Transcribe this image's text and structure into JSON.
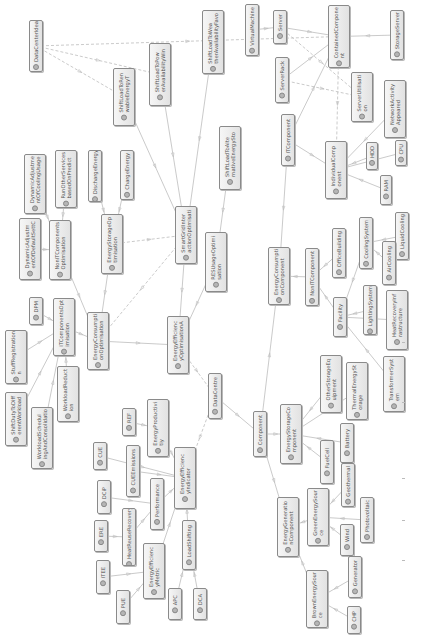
{
  "diagram": {
    "type": "uml-class-diagram",
    "orientation": "rotated-90-ccw",
    "colors": {
      "edge": "#bdbdbd",
      "node_border": "#8a8a8a",
      "node_fill": "#ececec",
      "text": "#555555"
    },
    "nodes": [
      {
        "id": "DataCenterIdea",
        "label": "DataCenterIdea",
        "x": 29,
        "y": 20,
        "w": 14,
        "h": 52
      },
      {
        "id": "ShiftLoadFutureAvailRenewable",
        "label": "ShiftLoadToRen\nwableEnergyT",
        "x": 113,
        "y": 68,
        "w": 22,
        "h": 58
      },
      {
        "id": "ShiftLoadToPowerAvailable",
        "label": "ShiftLoadToPow\nerAvailabilityWin",
        "x": 149,
        "y": 43,
        "w": 22,
        "h": 63
      },
      {
        "id": "ShiftLoadToWeatherFavor",
        "label": "ShiftLoadToWea\ntherAvailabilityFavo",
        "x": 202,
        "y": 10,
        "w": 22,
        "h": 64
      },
      {
        "id": "VirtualMachine",
        "label": "VirtualMachine",
        "x": 245,
        "y": 4,
        "w": 14,
        "h": 52
      },
      {
        "id": "Server",
        "label": "Server",
        "x": 273,
        "y": 10,
        "w": 14,
        "h": 34
      },
      {
        "id": "ContainedComponent",
        "label": "ContainedCompone\nnt",
        "x": 328,
        "y": 5,
        "w": 22,
        "h": 63
      },
      {
        "id": "StorageServer",
        "label": "StorageServer",
        "x": 390,
        "y": 10,
        "w": 14,
        "h": 50
      },
      {
        "id": "ServerRack",
        "label": "ServerRack",
        "x": 275,
        "y": 57,
        "w": 14,
        "h": 46
      },
      {
        "id": "ServerUtilisation",
        "label": "ServerUtilisati\non",
        "x": 351,
        "y": 72,
        "w": 22,
        "h": 50
      },
      {
        "id": "NetworkActivity",
        "label": "NetworkActivity\nAppeared",
        "x": 384,
        "y": 80,
        "w": 22,
        "h": 58
      },
      {
        "id": "ITComponent",
        "label": "ITComponent",
        "x": 281,
        "y": 114,
        "w": 14,
        "h": 52
      },
      {
        "id": "IndividualComponent",
        "label": "IndividualComp\nonent",
        "x": 325,
        "y": 141,
        "w": 22,
        "h": 58
      },
      {
        "id": "HDD",
        "label": "HDD",
        "x": 366,
        "y": 142,
        "w": 12,
        "h": 28
      },
      {
        "id": "CPU",
        "label": "CPU",
        "x": 395,
        "y": 140,
        "w": 12,
        "h": 26
      },
      {
        "id": "RAM",
        "label": "RAM",
        "x": 380,
        "y": 175,
        "w": 12,
        "h": 30
      },
      {
        "id": "ShiftLoadToAlternativeEnergy",
        "label": "ShiftLoadToAlte\nrnativeEnergySto",
        "x": 219,
        "y": 126,
        "w": 22,
        "h": 64
      },
      {
        "id": "RESUsageOptimisation",
        "label": "RESUsageOptimi\nsation",
        "x": 205,
        "y": 232,
        "w": 22,
        "h": 60
      },
      {
        "id": "SmartGridInteractionOptimisation",
        "label": "SmartGridInter\nactionOptimisati",
        "x": 175,
        "y": 206,
        "w": 22,
        "h": 58
      },
      {
        "id": "DischargeEnergy",
        "label": "DischargeEnergy",
        "x": 88,
        "y": 150,
        "w": 14,
        "h": 52
      },
      {
        "id": "ChargeEnergy",
        "label": "ChargeEnergy",
        "x": 120,
        "y": 150,
        "w": 14,
        "h": 50
      },
      {
        "id": "RunOtherServices",
        "label": "RunOtherServices\nbasedOnPredict",
        "x": 55,
        "y": 150,
        "w": 22,
        "h": 58
      },
      {
        "id": "DynamicAdjustmentOfCooling",
        "label": "DynamicAdjustme\nntOfCoolingUsage",
        "x": 24,
        "y": 154,
        "w": 22,
        "h": 60
      },
      {
        "id": "DynamicAdjustmentDefaultSettings",
        "label": "DynamicAdjustm\nentOfDefaultSettC",
        "x": 19,
        "y": 218,
        "w": 22,
        "h": 62
      },
      {
        "id": "NonITComponentsOptimisation",
        "label": "NonITComponents\nOptimisation",
        "x": 49,
        "y": 220,
        "w": 22,
        "h": 60
      },
      {
        "id": "EnergyStorageOptimisation",
        "label": "EnergyStorageOp\ntimisation",
        "x": 101,
        "y": 214,
        "w": 22,
        "h": 60
      },
      {
        "id": "DPM",
        "label": "DPM",
        "x": 29,
        "y": 297,
        "w": 14,
        "h": 28
      },
      {
        "id": "ITComponentsOptimisation",
        "label": "ITComponentsOpt\nimisation",
        "x": 53,
        "y": 298,
        "w": 22,
        "h": 58
      },
      {
        "id": "EnergyConsumptionOptimisation",
        "label": "EnergyConsumpti\nonOptimisation",
        "x": 87,
        "y": 312,
        "w": 22,
        "h": 58
      },
      {
        "id": "EnergyEfficiencyOptimisation",
        "label": "EnergyEfficienc\nyOptimisationA",
        "x": 167,
        "y": 316,
        "w": 22,
        "h": 58
      },
      {
        "id": "StuffRegistration",
        "label": "StuffRegistration\nn",
        "x": 5,
        "y": 330,
        "w": 22,
        "h": 54
      },
      {
        "id": "WorkloadReduction",
        "label": "WorkloadReduct\nion",
        "x": 57,
        "y": 366,
        "w": 22,
        "h": 56
      },
      {
        "id": "ShiftDutyToDifferentWorkload",
        "label": "ShiftDutyToDiff\nerentWorkload",
        "x": 5,
        "y": 392,
        "w": 22,
        "h": 54
      },
      {
        "id": "WorkloadSchedulingConsolidation",
        "label": "WorkloadSchedul\ningAndConsolidatio",
        "x": 31,
        "y": 407,
        "w": 22,
        "h": 62
      },
      {
        "id": "DataCentre",
        "label": "DataCentre",
        "x": 208,
        "y": 373,
        "w": 14,
        "h": 46
      },
      {
        "id": "REF",
        "label": "REF",
        "x": 122,
        "y": 408,
        "w": 14,
        "h": 28
      },
      {
        "id": "EnergyProductivity",
        "label": "EnergyProductivi\ntiy",
        "x": 147,
        "y": 399,
        "w": 22,
        "h": 58
      },
      {
        "id": "CUE",
        "label": "CUE",
        "x": 93,
        "y": 442,
        "w": 14,
        "h": 28
      },
      {
        "id": "CUEEmissions",
        "label": "CUEEmissions",
        "x": 126,
        "y": 445,
        "w": 14,
        "h": 52
      },
      {
        "id": "EnergyEfficiencyIndicator",
        "label": "EnergyEfficienc\nyIndicator",
        "x": 174,
        "y": 447,
        "w": 22,
        "h": 62
      },
      {
        "id": "DCiP",
        "label": "DCiP",
        "x": 97,
        "y": 480,
        "w": 14,
        "h": 34
      },
      {
        "id": "Performance",
        "label": "Performance",
        "x": 150,
        "y": 478,
        "w": 14,
        "h": 52
      },
      {
        "id": "ERE",
        "label": "ERE",
        "x": 94,
        "y": 520,
        "w": 14,
        "h": 32
      },
      {
        "id": "HeatReuseRecovery",
        "label": "HeatReuseRecovery",
        "x": 122,
        "y": 508,
        "w": 14,
        "h": 58
      },
      {
        "id": "LoadShifting",
        "label": "LoadShifting",
        "x": 182,
        "y": 520,
        "w": 14,
        "h": 50
      },
      {
        "id": "ITEE",
        "label": "ITEE",
        "x": 96,
        "y": 560,
        "w": 14,
        "h": 34
      },
      {
        "id": "EnergyEfficiencyMetric",
        "label": "EnergyEfficienc\nyMetric",
        "x": 143,
        "y": 543,
        "w": 22,
        "h": 56
      },
      {
        "id": "PUE",
        "label": "PUE",
        "x": 116,
        "y": 590,
        "w": 14,
        "h": 34
      },
      {
        "id": "APC",
        "label": "APC",
        "x": 168,
        "y": 588,
        "w": 14,
        "h": 32
      },
      {
        "id": "DCA",
        "label": "DCA",
        "x": 193,
        "y": 588,
        "w": 14,
        "h": 32
      },
      {
        "id": "Component",
        "label": "Component",
        "x": 253,
        "y": 411,
        "w": 14,
        "h": 46
      },
      {
        "id": "EnergyStorageComponent",
        "label": "EnergyStorageCo\nmponent",
        "x": 280,
        "y": 404,
        "w": 22,
        "h": 60
      },
      {
        "id": "OtherStorageEquipment",
        "label": "OtherStorageEq\nuipment",
        "x": 320,
        "y": 355,
        "w": 22,
        "h": 58
      },
      {
        "id": "ThermalEnergyStorage",
        "label": "ThermalEnergySt\norage",
        "x": 346,
        "y": 362,
        "w": 22,
        "h": 58
      },
      {
        "id": "FuelCell",
        "label": "FuelCell",
        "x": 320,
        "y": 440,
        "w": 14,
        "h": 44
      },
      {
        "id": "Battery",
        "label": "Battery",
        "x": 340,
        "y": 423,
        "w": 14,
        "h": 40
      },
      {
        "id": "EnergyConsumptionComponent",
        "label": "EnergyConsumpti\nonComponent",
        "x": 268,
        "y": 247,
        "w": 22,
        "h": 58
      },
      {
        "id": "NonITComponent",
        "label": "NonITComponent",
        "x": 305,
        "y": 248,
        "w": 14,
        "h": 58
      },
      {
        "id": "OfficeBuilding",
        "label": "OfficeBuilding",
        "x": 332,
        "y": 228,
        "w": 14,
        "h": 50
      },
      {
        "id": "CoolingSystem",
        "label": "CoolingSystem",
        "x": 359,
        "y": 217,
        "w": 14,
        "h": 52
      },
      {
        "id": "LiquidCooling",
        "label": "LiquidCooling",
        "x": 395,
        "y": 212,
        "w": 14,
        "h": 48
      },
      {
        "id": "AirCooling",
        "label": "AirCooling",
        "x": 382,
        "y": 241,
        "w": 14,
        "h": 44
      },
      {
        "id": "Facility",
        "label": "Facility",
        "x": 333,
        "y": 297,
        "w": 14,
        "h": 40
      },
      {
        "id": "LightingSystem",
        "label": "LightingSystem",
        "x": 363,
        "y": 285,
        "w": 14,
        "h": 50
      },
      {
        "id": "HeatRecoveryInfrastructure",
        "label": "HeatRecoveryInf\nrastructure",
        "x": 386,
        "y": 290,
        "w": 22,
        "h": 60
      },
      {
        "id": "TransformerSystem",
        "label": "TransformerSyst\nem",
        "x": 383,
        "y": 356,
        "w": 22,
        "h": 56
      },
      {
        "id": "EnergyGenerationComponent",
        "label": "EnergyGeneratio\nnComponent",
        "x": 277,
        "y": 497,
        "w": 22,
        "h": 60
      },
      {
        "id": "GreenEnergySource",
        "label": "GreenEnergySour\nce",
        "x": 307,
        "y": 488,
        "w": 22,
        "h": 58
      },
      {
        "id": "Geothermal",
        "label": "Geothermal",
        "x": 341,
        "y": 463,
        "w": 14,
        "h": 44
      },
      {
        "id": "Photovoltaic",
        "label": "Photovoltaic",
        "x": 360,
        "y": 497,
        "w": 14,
        "h": 46
      },
      {
        "id": "Wind",
        "label": "Wind",
        "x": 340,
        "y": 524,
        "w": 14,
        "h": 32
      },
      {
        "id": "BrownEnergySource",
        "label": "BrownEnergySour\nce",
        "x": 306,
        "y": 570,
        "w": 22,
        "h": 58
      },
      {
        "id": "Generator",
        "label": "Generator",
        "x": 348,
        "y": 556,
        "w": 14,
        "h": 42
      },
      {
        "id": "CHP",
        "label": "CHP",
        "x": 347,
        "y": 606,
        "w": 14,
        "h": 28
      }
    ],
    "edges": [
      [
        "DataCenterIdea",
        "ShiftLoadFutureAvailRenewable",
        "dashed"
      ],
      [
        "DataCenterIdea",
        "ShiftLoadToPowerAvailable",
        "dashed"
      ],
      [
        "DataCenterIdea",
        "ContainedComponent",
        "dashed"
      ],
      [
        "ShiftLoadToPowerAvailable",
        "SmartGridInteractionOptimisation",
        "solid"
      ],
      [
        "ShiftLoadFutureAvailRenewable",
        "SmartGridInteractionOptimisation",
        "solid"
      ],
      [
        "ShiftLoadToWeatherFavor",
        "SmartGridInteractionOptimisation",
        "solid"
      ],
      [
        "ShiftLoadToAlternativeEnergy",
        "RESUsageOptimisation",
        "solid"
      ],
      [
        "VirtualMachine",
        "Server",
        "solid"
      ],
      [
        "Server",
        "ContainedComponent",
        "solid"
      ],
      [
        "StorageServer",
        "ContainedComponent",
        "solid"
      ],
      [
        "ServerRack",
        "ContainedComponent",
        "solid"
      ],
      [
        "Server",
        "ServerUtilisation",
        "dashed"
      ],
      [
        "ServerRack",
        "ServerUtilisation",
        "dashed"
      ],
      [
        "ContainedComponent",
        "IndividualComponent",
        "dashed"
      ],
      [
        "ITComponent",
        "ContainedComponent",
        "solid"
      ],
      [
        "ITComponent",
        "IndividualComponent",
        "solid"
      ],
      [
        "HDD",
        "IndividualComponent",
        "solid"
      ],
      [
        "CPU",
        "IndividualComponent",
        "solid"
      ],
      [
        "RAM",
        "IndividualComponent",
        "solid"
      ],
      [
        "NetworkActivity",
        "IndividualComponent",
        "solid"
      ],
      [
        "ITComponent",
        "EnergyConsumptionComponent",
        "solid"
      ],
      [
        "DischargeEnergy",
        "EnergyStorageOptimisation",
        "solid"
      ],
      [
        "ChargeEnergy",
        "EnergyStorageOptimisation",
        "solid"
      ],
      [
        "RunOtherServices",
        "NonITComponentsOptimisation",
        "solid"
      ],
      [
        "DynamicAdjustmentOfCooling",
        "NonITComponentsOptimisation",
        "solid"
      ],
      [
        "DynamicAdjustmentDefaultSettings",
        "NonITComponentsOptimisation",
        "solid"
      ],
      [
        "EnergyStorageOptimisation",
        "SmartGridInteractionOptimisation",
        "dashed"
      ],
      [
        "NonITComponentsOptimisation",
        "EnergyConsumptionOptimisation",
        "solid"
      ],
      [
        "EnergyStorageOptimisation",
        "EnergyConsumptionOptimisation",
        "solid"
      ],
      [
        "SmartGridInteractionOptimisation",
        "EnergyConsumptionOptimisation",
        "dashed"
      ],
      [
        "SmartGridInteractionOptimisation",
        "EnergyEfficiencyOptimisation",
        "solid"
      ],
      [
        "RESUsageOptimisation",
        "EnergyEfficiencyOptimisation",
        "solid"
      ],
      [
        "DPM",
        "ITComponentsOptimisation",
        "solid"
      ],
      [
        "StuffRegistration",
        "ITComponentsOptimisation",
        "solid"
      ],
      [
        "ShiftDutyToDifferentWorkload",
        "ITComponentsOptimisation",
        "solid"
      ],
      [
        "WorkloadReduction",
        "ITComponentsOptimisation",
        "solid"
      ],
      [
        "WorkloadSchedulingConsolidation",
        "ITComponentsOptimisation",
        "solid"
      ],
      [
        "ITComponentsOptimisation",
        "EnergyConsumptionOptimisation",
        "solid"
      ],
      [
        "EnergyConsumptionOptimisation",
        "EnergyEfficiencyOptimisation",
        "solid"
      ],
      [
        "EnergyEfficiencyOptimisation",
        "DataCentre",
        "dashed"
      ],
      [
        "DataCentre",
        "Component",
        "solid"
      ],
      [
        "DataCentre",
        "EnergyEfficiencyIndicator",
        "dashed"
      ],
      [
        "REF",
        "EnergyProductivity",
        "solid"
      ],
      [
        "EnergyProductivity",
        "EnergyEfficiencyIndicator",
        "solid"
      ],
      [
        "CUE",
        "EnergyEfficiencyIndicator",
        "solid"
      ],
      [
        "CUEEmissions",
        "EnergyEfficiencyIndicator",
        "solid"
      ],
      [
        "DCiP",
        "Performance",
        "solid"
      ],
      [
        "Performance",
        "EnergyEfficiencyIndicator",
        "solid"
      ],
      [
        "HeatReuseRecovery",
        "Performance",
        "solid"
      ],
      [
        "ERE",
        "HeatReuseRecovery",
        "solid"
      ],
      [
        "ITEE",
        "EnergyEfficiencyMetric",
        "solid"
      ],
      [
        "PUE",
        "EnergyEfficiencyMetric",
        "solid"
      ],
      [
        "EnergyEfficiencyMetric",
        "EnergyEfficiencyIndicator",
        "solid"
      ],
      [
        "LoadShifting",
        "EnergyEfficiencyIndicator",
        "solid"
      ],
      [
        "APC",
        "LoadShifting",
        "solid"
      ],
      [
        "DCA",
        "LoadShifting",
        "solid"
      ],
      [
        "Component",
        "EnergyConsumptionComponent",
        "solid"
      ],
      [
        "Component",
        "EnergyStorageComponent",
        "solid"
      ],
      [
        "Component",
        "EnergyGenerationComponent",
        "solid"
      ],
      [
        "OtherStorageEquipment",
        "EnergyStorageComponent",
        "solid"
      ],
      [
        "ThermalEnergyStorage",
        "EnergyStorageComponent",
        "solid"
      ],
      [
        "FuelCell",
        "EnergyStorageComponent",
        "solid"
      ],
      [
        "Battery",
        "EnergyStorageComponent",
        "solid"
      ],
      [
        "NonITComponent",
        "EnergyConsumptionComponent",
        "solid"
      ],
      [
        "OfficeBuilding",
        "NonITComponent",
        "solid"
      ],
      [
        "Facility",
        "NonITComponent",
        "solid"
      ],
      [
        "CoolingSystem",
        "Facility",
        "solid"
      ],
      [
        "LightingSystem",
        "Facility",
        "solid"
      ],
      [
        "HeatRecoveryInfrastructure",
        "Facility",
        "solid"
      ],
      [
        "TransformerSystem",
        "Facility",
        "solid"
      ],
      [
        "LiquidCooling",
        "CoolingSystem",
        "solid"
      ],
      [
        "AirCooling",
        "CoolingSystem",
        "solid"
      ],
      [
        "GreenEnergySource",
        "EnergyGenerationComponent",
        "solid"
      ],
      [
        "BrownEnergySource",
        "EnergyGenerationComponent",
        "solid"
      ],
      [
        "Geothermal",
        "GreenEnergySource",
        "solid"
      ],
      [
        "Photovoltaic",
        "GreenEnergySource",
        "solid"
      ],
      [
        "Wind",
        "GreenEnergySource",
        "solid"
      ],
      [
        "Generator",
        "BrownEnergySource",
        "solid"
      ],
      [
        "CHP",
        "BrownEnergySource",
        "solid"
      ]
    ]
  }
}
